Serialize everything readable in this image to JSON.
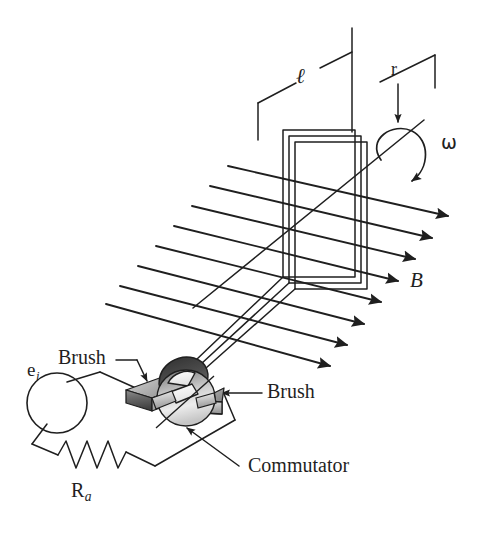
{
  "figure": {
    "type": "technical-line-diagram",
    "background_color": "#ffffff",
    "line_color": "#1f1f1f"
  },
  "labels": {
    "length": "ℓ",
    "radius": "r",
    "angular_velocity": "ω",
    "field": "B",
    "brush_left": "Brush",
    "brush_right": "Brush",
    "commutator": "Commutator",
    "source": "e",
    "source_sub": "i",
    "resistor": "R",
    "resistor_sub": "a"
  },
  "components": {
    "voltage_source": {
      "name": "e_i",
      "shape": "circle",
      "radius": 30
    },
    "armature_resistance": {
      "name": "R_a",
      "shape": "zigzag-resistor",
      "peaks": 6
    },
    "commutator": {
      "name": "Commutator",
      "shape": "shaded-cylinder",
      "shading": "grayscale-gradient"
    },
    "brushes": {
      "count": 2,
      "shape": "gray-bar",
      "positions": [
        "left",
        "right"
      ]
    },
    "armature_coil": {
      "turns": 3,
      "shape": "parallelogram-loop"
    },
    "field_lines": {
      "count": 8,
      "arrowhead": "solid-triangle",
      "direction": "down-right"
    }
  },
  "colors": {
    "ink": "#1f1f1f",
    "metal_light": "#f2f2f2",
    "metal_mid": "#b8b8b8",
    "metal_dark": "#555555",
    "metal_darkest": "#3a3a3a"
  }
}
